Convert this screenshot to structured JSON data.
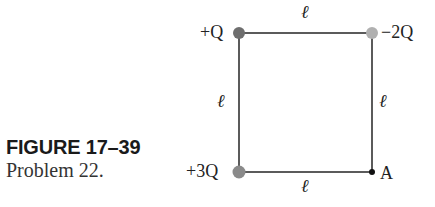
{
  "figure": {
    "caption_title": "FIGURE 17–39",
    "caption_sub": "Problem 22.",
    "charges": [
      {
        "label": "+Q",
        "position": "top-left",
        "color": "#6e6e6e"
      },
      {
        "label": "−2Q",
        "position": "top-right",
        "color": "#b0b0b0"
      },
      {
        "label": "+3Q",
        "position": "bottom-left",
        "color": "#8a8a8a"
      }
    ],
    "point": {
      "label": "A",
      "position": "bottom-right",
      "color": "#111111"
    },
    "side_labels": {
      "top": "ℓ",
      "left": "ℓ",
      "right": "ℓ",
      "bottom": "ℓ"
    },
    "line_color": "#333333"
  }
}
